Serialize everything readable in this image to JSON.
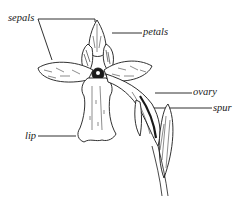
{
  "diagram": {
    "labels": {
      "sepals": "sepals",
      "petals": "petals",
      "ovary": "ovary",
      "spur": "spur",
      "lip": "lip"
    },
    "colors": {
      "ink": "#1a1a1a",
      "background": "#ffffff"
    }
  }
}
